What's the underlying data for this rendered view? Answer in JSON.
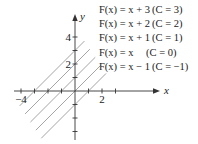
{
  "chart_data": {
    "type": "line",
    "title": "",
    "xlabel": "x",
    "ylabel": "y",
    "xlim": [
      -4.5,
      3.5
    ],
    "ylim": [
      -4.5,
      5
    ],
    "x_ticks": [
      -4,
      -3,
      -2,
      -1,
      1,
      2,
      3
    ],
    "y_ticks": [
      -4,
      -3,
      -2,
      -1,
      1,
      2,
      3,
      4
    ],
    "x_tick_labels": [
      {
        "value": -4,
        "label": "−4"
      },
      {
        "value": 2,
        "label": "2"
      }
    ],
    "y_tick_labels": [
      {
        "value": 4,
        "label": "4"
      },
      {
        "value": 2,
        "label": "2"
      }
    ],
    "grid": false,
    "series": [
      {
        "name": "F(x) = x + 3 (C = 3)",
        "C": 3,
        "x": [
          -4.1,
          0.7
        ],
        "y": [
          -1.1,
          3.7
        ]
      },
      {
        "name": "F(x) = x + 2 (C = 2)",
        "C": 2,
        "x": [
          -3.7,
          1.1
        ],
        "y": [
          -1.7,
          3.1
        ]
      },
      {
        "name": "F(x) = x + 1 (C = 1)",
        "C": 1,
        "x": [
          -3.3,
          1.5
        ],
        "y": [
          -2.3,
          2.5
        ]
      },
      {
        "name": "F(x) = x     (C = 0)",
        "C": 0,
        "x": [
          -2.9,
          1.9
        ],
        "y": [
          -2.9,
          1.9
        ]
      },
      {
        "name": "F(x) = x − 1 (C = −1)",
        "C": -1,
        "x": [
          -2.5,
          2.3
        ],
        "y": [
          -3.5,
          1.3
        ]
      }
    ],
    "legend": {
      "position": "upper-right",
      "entries": [
        {
          "lhs": "F(x) = x + 3",
          "cond": "(C = 3)"
        },
        {
          "lhs": "F(x) = x + 2",
          "cond": "(C = 2)"
        },
        {
          "lhs": "F(x) = x + 1",
          "cond": "(C = 1)"
        },
        {
          "lhs": "F(x) = x",
          "cond": "(C = 0)"
        },
        {
          "lhs": "F(x) = x − 1",
          "cond": "(C = −1)"
        }
      ]
    },
    "line_color": "#9a9a9a",
    "axis_color": "#333333"
  }
}
